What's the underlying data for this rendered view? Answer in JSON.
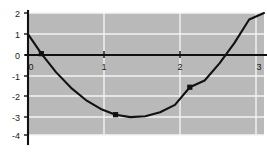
{
  "chart_data": {
    "type": "line",
    "title": "",
    "subtitle": "",
    "xlabel": "",
    "ylabel": "",
    "xlim": [
      -0.18,
      3.0
    ],
    "ylim": [
      -4,
      2
    ],
    "grid": true,
    "legend": null,
    "x_ticks": [
      0,
      1,
      2,
      3
    ],
    "x_tick_labels": [
      "0",
      "1",
      "2",
      "3"
    ],
    "y_ticks": [
      2,
      1,
      0,
      -1,
      -2,
      -3,
      -4
    ],
    "y_tick_labels": [
      "2",
      "1",
      "0",
      "-1",
      "-2",
      "-3",
      "-4"
    ],
    "function": "y = 2x^2 - 5x",
    "series": [
      {
        "name": "curve",
        "color": "#111111",
        "x": [
          -0.18,
          0.0,
          0.2,
          0.4,
          0.6,
          0.8,
          1.0,
          1.2,
          1.4,
          1.6,
          1.8,
          2.0,
          2.2,
          2.4,
          2.6,
          2.8,
          3.0
        ],
        "y": [
          0.96,
          0.0,
          -0.92,
          -1.68,
          -2.28,
          -2.72,
          -3.0,
          -3.12,
          -3.08,
          -2.88,
          -2.52,
          -1.65,
          -1.32,
          -0.48,
          0.52,
          1.68,
          2.0
        ]
      }
    ],
    "markers": [
      {
        "x": 0,
        "y": 0,
        "label": "(0, 0)"
      },
      {
        "x": 1,
        "y": -3,
        "label": "(1, -3)"
      },
      {
        "x": 2,
        "y": -1.65,
        "label": "(2, -1.65)"
      }
    ],
    "colors": {
      "plot_background": "#b9b9b9",
      "figure_background": "#ffffff",
      "gridline": "#f4f4f4",
      "axis": "#111111",
      "curve": "#111111",
      "marker": "#111111"
    }
  }
}
